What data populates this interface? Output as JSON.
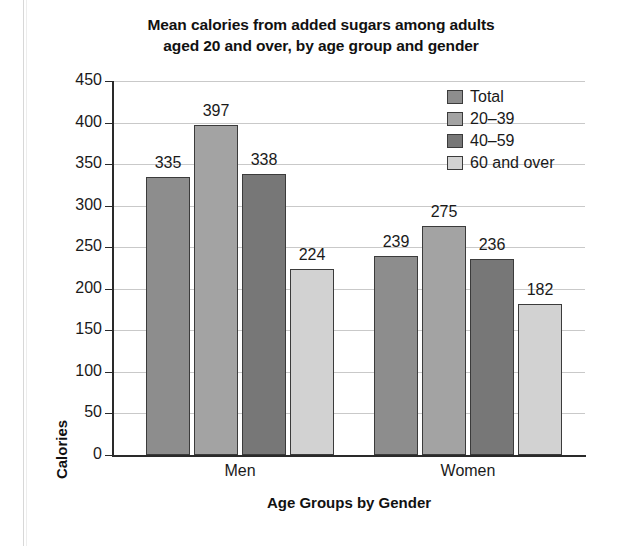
{
  "chart_data": {
    "type": "bar",
    "title": "Mean calories from added sugars among adults aged 20 and over, by age group and gender",
    "title_line1": "Mean calories from added sugars among adults",
    "title_line2": "aged 20 and over, by age group and gender",
    "xlabel": "Age Groups by Gender",
    "ylabel": "Calories",
    "categories": [
      "Men",
      "Women"
    ],
    "series": [
      {
        "name": "Total",
        "values": [
          335,
          397
        ]
      },
      {
        "name": "20–39",
        "values": [
          397,
          275
        ]
      },
      {
        "name": "40–59",
        "values": [
          338,
          236
        ]
      },
      {
        "name": "60 and over",
        "values": [
          224,
          182
        ]
      }
    ],
    "groups": [
      {
        "label": "Men",
        "bars": [
          {
            "series": "Total",
            "value": 335,
            "color": "#8d8d8d"
          },
          {
            "series": "20–39",
            "value": 397,
            "color": "#a3a3a3"
          },
          {
            "series": "40–59",
            "value": 338,
            "color": "#777777"
          },
          {
            "series": "60 and over",
            "value": 224,
            "color": "#d2d2d2"
          }
        ]
      },
      {
        "label": "Women",
        "bars": [
          {
            "series": "Total",
            "value": 239,
            "color": "#8d8d8d"
          },
          {
            "series": "20–39",
            "value": 275,
            "color": "#a3a3a3"
          },
          {
            "series": "40–59",
            "value": 236,
            "color": "#777777"
          },
          {
            "series": "60 and over",
            "value": 182,
            "color": "#d2d2d2"
          }
        ]
      }
    ],
    "ylim": [
      0,
      450
    ],
    "ytick_step": 50,
    "yticks": [
      0,
      50,
      100,
      150,
      200,
      250,
      300,
      350,
      400,
      450
    ],
    "ytick_labels": [
      "0",
      "50",
      "100",
      "150",
      "200",
      "250",
      "300",
      "350",
      "400",
      "450"
    ],
    "grid": true,
    "grid_axis": "y",
    "legend_position": "top-right",
    "legend": [
      {
        "label": "Total",
        "color": "#8d8d8d"
      },
      {
        "label": "20–39",
        "color": "#a3a3a3"
      },
      {
        "label": "40–59",
        "color": "#777777"
      },
      {
        "label": "60 and over",
        "color": "#d2d2d2"
      }
    ],
    "background": "#ffffff",
    "bar_edge_color": "#3b3b3b",
    "grid_color": "#c9c9c9",
    "axis_color": "#2a2a2a"
  }
}
